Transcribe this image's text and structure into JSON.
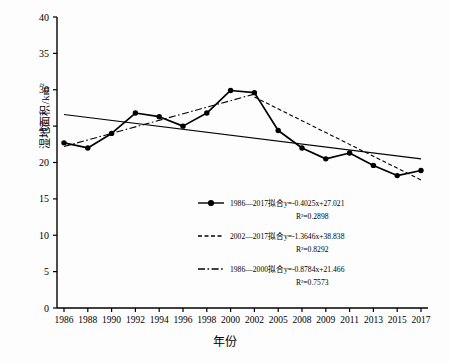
{
  "chart_data": {
    "type": "line",
    "title": "",
    "xlabel": "年份",
    "ylabel": "湿地面积/km²",
    "ylim": [
      0,
      40
    ],
    "ytick_step": 5,
    "yticks": [
      "0",
      "5",
      "10",
      "15",
      "20",
      "25",
      "30",
      "35",
      "40"
    ],
    "grid": false,
    "legend_position": "inside-lower-center",
    "categories": [
      "1986",
      "1988",
      "1990",
      "1992",
      "1994",
      "1996",
      "1998",
      "2000",
      "2002",
      "2005",
      "2008",
      "2009",
      "2011",
      "2013",
      "2015",
      "2017"
    ],
    "series": [
      {
        "name": "湿地面积",
        "style": "solid-markers",
        "values": [
          22.7,
          22.0,
          24.0,
          26.8,
          26.3,
          25.0,
          26.8,
          29.9,
          29.6,
          24.4,
          22.0,
          20.5,
          21.3,
          19.6,
          18.2,
          18.9
        ]
      }
    ],
    "trendlines": [
      {
        "id": "fit-1986-2017",
        "label": "1986—2017拟合y=-0.4025x+27.021",
        "r2_label": "R²=0.2898",
        "slope": -0.4025,
        "intercept": 27.021,
        "r2": 0.2898,
        "style": "solid",
        "marker": true,
        "x_start_category": "1986",
        "x_end_category": "2017",
        "y_start": 26.6,
        "y_end": 20.5
      },
      {
        "id": "fit-2002-2017",
        "label": "2002—2017拟合y=-1.3646x+38.838",
        "r2_label": "R²=0.8292",
        "slope": -1.3646,
        "intercept": 38.838,
        "r2": 0.8292,
        "style": "dashed",
        "marker": false,
        "x_start_category": "2002",
        "x_end_category": "2017",
        "y_start": 29.0,
        "y_end": 17.6
      },
      {
        "id": "fit-1986-2000",
        "label": "1986—2000拟合y=-0.8784x+21.466",
        "r2_label": "R²=0.7573",
        "slope": -0.8784,
        "intercept": 21.466,
        "r2": 0.7573,
        "style": "dash-dot",
        "marker": false,
        "x_start_category": "1986",
        "x_end_category": "2002",
        "y_start": 22.2,
        "y_end": 29.4
      }
    ],
    "colors": {
      "line": "#000000",
      "axis": "#000000",
      "background": "#fdfdfd"
    }
  }
}
